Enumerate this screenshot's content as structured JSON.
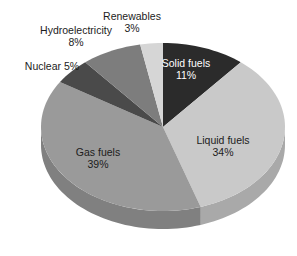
{
  "chart_data": {
    "type": "pie",
    "title": "",
    "subtitle": "",
    "xlabel": "",
    "ylabel": "",
    "legend_position": "none",
    "grid": false,
    "three_d": true,
    "start_angle_deg": 0,
    "direction": "clockwise",
    "categories": [
      "Solid fuels",
      "Liquid fuels",
      "Gas fuels",
      "Nuclear",
      "Hydroelectricity",
      "Renewables"
    ],
    "values": [
      11,
      34,
      39,
      5,
      8,
      3
    ],
    "unit": "%",
    "slices": [
      {
        "name": "Solid fuels",
        "label": "Solid fuels",
        "value": 11,
        "value_label": "11%",
        "color": "#2b2b2b",
        "side_color": "#1d1d1d",
        "label_placement": "inside",
        "label_color": "#ffffff"
      },
      {
        "name": "Liquid fuels",
        "label": "Liquid fuels",
        "value": 34,
        "value_label": "34%",
        "color": "#c9c9c9",
        "side_color": "#a9a9a9",
        "label_placement": "inside",
        "label_color": "#1c1c1c"
      },
      {
        "name": "Gas fuels",
        "label": "Gas fuels",
        "value": 39,
        "value_label": "39%",
        "color": "#9a9a9a",
        "side_color": "#808080",
        "label_placement": "inside",
        "label_color": "#1c1c1c"
      },
      {
        "name": "Nuclear",
        "label": "Nuclear",
        "value": 5,
        "value_label": "5%",
        "color": "#4a4a4a",
        "side_color": "#3b3b3b",
        "label_placement": "outside",
        "label_color": "#1c1c1c"
      },
      {
        "name": "Hydroelectricity",
        "label": "Hydroelectricity",
        "value": 8,
        "value_label": "8%",
        "color": "#7d7d7d",
        "side_color": "#686868",
        "label_placement": "outside",
        "label_color": "#1c1c1c"
      },
      {
        "name": "Renewables",
        "label": "Renewables",
        "value": 3,
        "value_label": "3%",
        "color": "#d6d6d6",
        "side_color": "#b4b4b4",
        "label_placement": "outside",
        "label_color": "#1c1c1c"
      }
    ]
  },
  "labels": {
    "renewables": {
      "name": "Renewables",
      "pct": "3%"
    },
    "hydroelectricity": {
      "name": "Hydroelectricity",
      "pct": "8%"
    },
    "nuclear": {
      "name": "Nuclear 5%",
      "pct": ""
    },
    "solid_fuels": {
      "name": "Solid fuels",
      "pct": "11%"
    },
    "liquid_fuels": {
      "name": "Liquid fuels",
      "pct": "34%"
    },
    "gas_fuels": {
      "name": "Gas fuels",
      "pct": "39%"
    }
  },
  "colors": {
    "background": "#ffffff",
    "text": "#1c1c1c",
    "inverse_text": "#ffffff"
  }
}
